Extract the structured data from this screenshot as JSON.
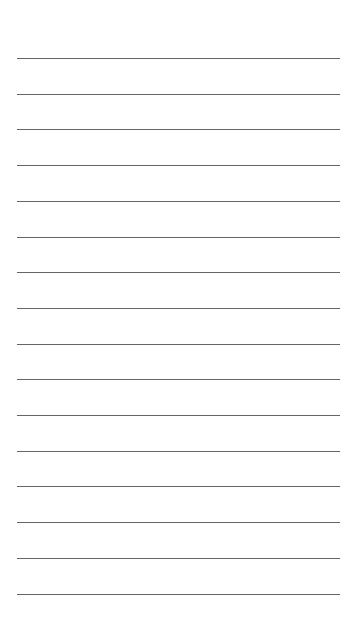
{
  "page": {
    "type": "lined-paper",
    "background_color": "#ffffff",
    "line_color": "#4a4a4a",
    "line_count": 16,
    "first_line_y": 58,
    "line_spacing": 35.7,
    "line_left": 17,
    "line_width": 323
  }
}
